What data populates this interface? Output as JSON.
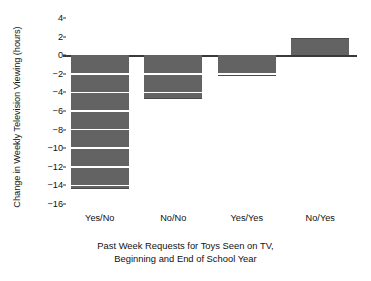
{
  "chart_data": {
    "type": "bar",
    "title": "",
    "subtitle": "",
    "xlabel": "Past Week Requests for Toys Seen on TV, Beginning and End of School Year",
    "xlabel_lines": [
      "Past Week Requests for Toys Seen on TV,",
      "Beginning and End of School Year"
    ],
    "ylabel": "Change in Weekly Television Viewing (hours)",
    "categories": [
      "Yes/No",
      "No/No",
      "Yes/Yes",
      "No/Yes"
    ],
    "values": [
      -14.4,
      -4.7,
      -2.2,
      1.9
    ],
    "series": [
      {
        "name": "Change in Weekly Television Viewing",
        "values": [
          -14.4,
          -4.7,
          -2.2,
          1.9
        ]
      }
    ],
    "ylim": [
      -16,
      4
    ],
    "yticks": [
      4,
      2,
      0,
      -2,
      -4,
      -6,
      -8,
      -10,
      -12,
      -14,
      -16
    ],
    "ytick_labels": [
      "4",
      "2",
      "0",
      "−2",
      "−4",
      "−6",
      "−8",
      "−10",
      "−12",
      "−14",
      "−16"
    ],
    "grid": false,
    "legend": "none",
    "bar_color": "#636363",
    "axis_color": "#3a3a3a",
    "background": "#ffffff"
  }
}
